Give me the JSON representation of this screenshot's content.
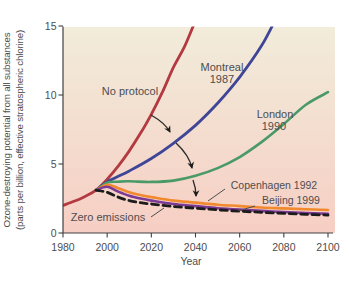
{
  "chart_data": {
    "type": "line",
    "title": "",
    "xlabel": "Year",
    "ylabel": "Ozone-destroying potential from all substances (parts per billion, effective stratospheric chlorine)",
    "xlim": [
      1980,
      2100
    ],
    "ylim": [
      0,
      15
    ],
    "x_ticks": [
      1980,
      2000,
      2020,
      2040,
      2060,
      2080,
      2100
    ],
    "y_ticks": [
      0,
      5,
      10,
      15
    ],
    "grid": false,
    "legend": "inline-annotations",
    "background_gradient": {
      "top": "#f2ecdb",
      "mid": "#f3dfd0",
      "bottom": "#f7cec4"
    },
    "series": [
      {
        "name": "No protocol",
        "color": "#b23a40",
        "dash": "solid",
        "points": [
          [
            1980,
            2.0
          ],
          [
            1985,
            2.3
          ],
          [
            1990,
            2.65
          ],
          [
            1995,
            3.1
          ],
          [
            2000,
            3.9
          ],
          [
            2005,
            4.85
          ],
          [
            2010,
            5.95
          ],
          [
            2015,
            7.2
          ],
          [
            2020,
            8.6
          ],
          [
            2025,
            10.2
          ],
          [
            2030,
            12.0
          ],
          [
            2035,
            13.5
          ],
          [
            2040,
            15.4
          ]
        ]
      },
      {
        "name": "Montreal 1987",
        "color": "#3f4697",
        "dash": "solid",
        "points": [
          [
            1995,
            3.1
          ],
          [
            2000,
            3.7
          ],
          [
            2010,
            4.5
          ],
          [
            2020,
            5.4
          ],
          [
            2030,
            6.5
          ],
          [
            2040,
            7.8
          ],
          [
            2050,
            9.4
          ],
          [
            2060,
            11.3
          ],
          [
            2070,
            13.6
          ],
          [
            2076,
            15.4
          ]
        ]
      },
      {
        "name": "London 1990",
        "color": "#4a9a68",
        "dash": "solid",
        "points": [
          [
            1995,
            3.1
          ],
          [
            2000,
            3.65
          ],
          [
            2005,
            3.72
          ],
          [
            2010,
            3.75
          ],
          [
            2020,
            3.7
          ],
          [
            2030,
            3.8
          ],
          [
            2040,
            4.15
          ],
          [
            2050,
            4.7
          ],
          [
            2060,
            5.5
          ],
          [
            2070,
            6.6
          ],
          [
            2080,
            7.9
          ],
          [
            2090,
            9.3
          ],
          [
            2100,
            10.2
          ]
        ]
      },
      {
        "name": "Copenhagen 1992",
        "color": "#f18a2e",
        "dash": "solid",
        "points": [
          [
            1995,
            3.1
          ],
          [
            2000,
            3.5
          ],
          [
            2005,
            3.25
          ],
          [
            2010,
            2.95
          ],
          [
            2015,
            2.75
          ],
          [
            2020,
            2.6
          ],
          [
            2030,
            2.35
          ],
          [
            2040,
            2.2
          ],
          [
            2050,
            2.05
          ],
          [
            2060,
            1.95
          ],
          [
            2070,
            1.85
          ],
          [
            2080,
            1.78
          ],
          [
            2090,
            1.72
          ],
          [
            2100,
            1.67
          ]
        ]
      },
      {
        "name": "Beijing 1999",
        "color": "#7c3a94",
        "dash": "solid",
        "points": [
          [
            1995,
            3.1
          ],
          [
            2000,
            3.35
          ],
          [
            2005,
            3.0
          ],
          [
            2010,
            2.7
          ],
          [
            2015,
            2.5
          ],
          [
            2020,
            2.35
          ],
          [
            2030,
            2.1
          ],
          [
            2040,
            1.95
          ],
          [
            2050,
            1.8
          ],
          [
            2060,
            1.7
          ],
          [
            2070,
            1.6
          ],
          [
            2080,
            1.52
          ],
          [
            2090,
            1.45
          ],
          [
            2100,
            1.4
          ]
        ]
      },
      {
        "name": "Zero emissions",
        "color": "#1c1c1c",
        "dash": "dashed",
        "points": [
          [
            1995,
            3.1
          ],
          [
            2000,
            2.95
          ],
          [
            2005,
            2.6
          ],
          [
            2010,
            2.35
          ],
          [
            2015,
            2.2
          ],
          [
            2020,
            2.1
          ],
          [
            2030,
            1.92
          ],
          [
            2040,
            1.8
          ],
          [
            2050,
            1.68
          ],
          [
            2060,
            1.58
          ],
          [
            2070,
            1.5
          ],
          [
            2080,
            1.42
          ],
          [
            2090,
            1.35
          ],
          [
            2100,
            1.3
          ]
        ]
      }
    ]
  },
  "labels": {
    "no_protocol": "No protocol",
    "montreal": "Montreal",
    "montreal_year": "1987",
    "london": "London",
    "london_year": "1990",
    "copenhagen": "Copenhagen 1992",
    "beijing": "Beijing 1999",
    "zero_emissions": "Zero emissions",
    "xlabel": "Year",
    "ylabel_line1": "Ozone-destroying potential from all substances",
    "ylabel_line2": "(parts per billion, effective stratospheric chlorine)"
  }
}
